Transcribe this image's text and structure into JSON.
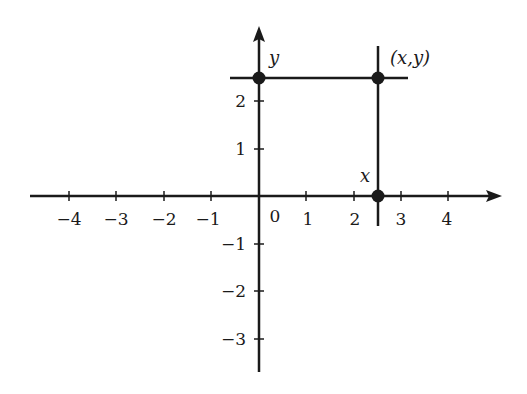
{
  "figure": {
    "type": "cartesian-coordinate-diagram",
    "x_axis": {
      "tick_labels": [
        "−4",
        "−3",
        "−2",
        "−1",
        "1",
        "2",
        "3",
        "4"
      ],
      "tick_values": [
        -4,
        -3,
        -2,
        -1,
        1,
        2,
        3,
        4
      ],
      "origin_label": "0",
      "range": [
        -4.8,
        5
      ]
    },
    "y_axis": {
      "tick_labels": [
        "2",
        "1",
        "−1",
        "−2",
        "−3"
      ],
      "tick_values": [
        2,
        1,
        -1,
        -2,
        -3
      ],
      "range": [
        -3.6,
        3.0
      ]
    },
    "point": {
      "label": "(x,y)",
      "x": 2.5,
      "y": 2.5
    },
    "projections": {
      "x_label": "x",
      "y_label": "y"
    },
    "colors": {
      "ink": "#1a1a1a",
      "background": "#ffffff"
    }
  }
}
